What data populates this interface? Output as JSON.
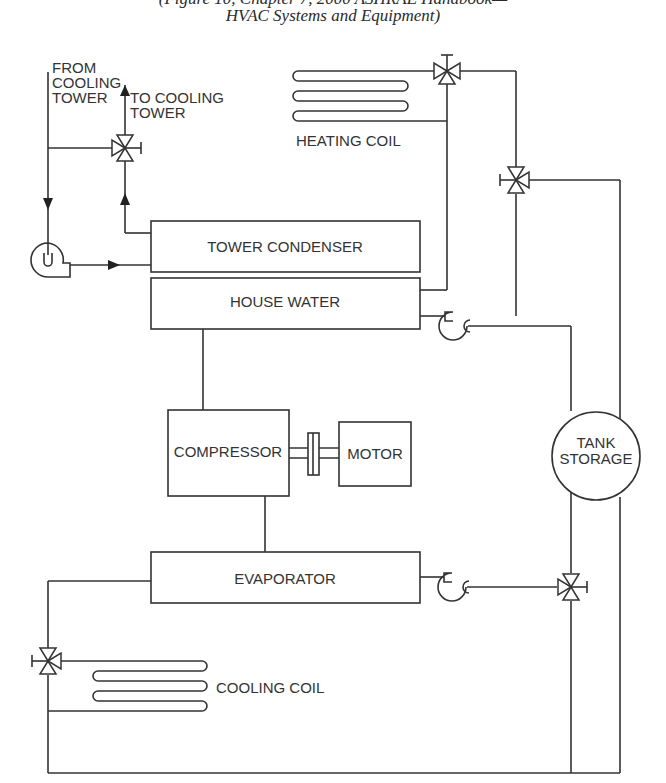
{
  "caption": {
    "line1": "(Figure 10, Chapter 7, 2000 ASHRAE Handbook—",
    "line2": "HVAC Systems and Equipment)"
  },
  "labels": {
    "from_cooling_tower": [
      "FROM",
      "COOLING",
      "TOWER"
    ],
    "to_cooling_tower": [
      "TO COOLING",
      "TOWER"
    ],
    "heating_coil": "HEATING COIL",
    "tower_condenser": "TOWER CONDENSER",
    "house_water": "HOUSE WATER",
    "compressor": "COMPRESSOR",
    "motor": "MOTOR",
    "tank_storage": [
      "TANK",
      "STORAGE"
    ],
    "evaporator": "EVAPORATOR",
    "cooling_coil": "COOLING COIL"
  },
  "components": [
    {
      "name": "tower-condenser",
      "type": "heat-exchanger"
    },
    {
      "name": "house-water",
      "type": "heat-exchanger"
    },
    {
      "name": "compressor",
      "type": "compressor"
    },
    {
      "name": "motor",
      "type": "motor"
    },
    {
      "name": "evaporator",
      "type": "heat-exchanger"
    },
    {
      "name": "tank-storage",
      "type": "tank"
    },
    {
      "name": "heating-coil",
      "type": "coil"
    },
    {
      "name": "cooling-coil",
      "type": "coil"
    },
    {
      "name": "pumps",
      "type": "pump",
      "count": 3
    },
    {
      "name": "three-way-valves",
      "type": "valve",
      "count": 5
    }
  ],
  "colors": {
    "line": "#333333",
    "background": "#ffffff"
  }
}
